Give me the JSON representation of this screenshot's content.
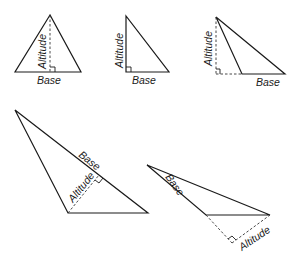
{
  "diagram": {
    "title": "",
    "labels": {
      "base": "Base",
      "altitude": "Altitude"
    },
    "figures": [
      {
        "id": "acute-triangle",
        "base_label": "Base",
        "altitude_label": "Altitude",
        "altitude_position": "inside"
      },
      {
        "id": "right-triangle",
        "base_label": "Base",
        "altitude_label": "Altitude",
        "altitude_position": "side"
      },
      {
        "id": "obtuse-triangle",
        "base_label": "Base",
        "altitude_label": "Altitude",
        "altitude_position": "outside"
      },
      {
        "id": "oblique-triangle-long-base",
        "base_label": "Base",
        "altitude_label": "Altitude",
        "altitude_position": "inside"
      },
      {
        "id": "oblique-triangle-extended-base",
        "base_label": "Base",
        "altitude_label": "Altitude",
        "altitude_position": "outside"
      }
    ]
  }
}
